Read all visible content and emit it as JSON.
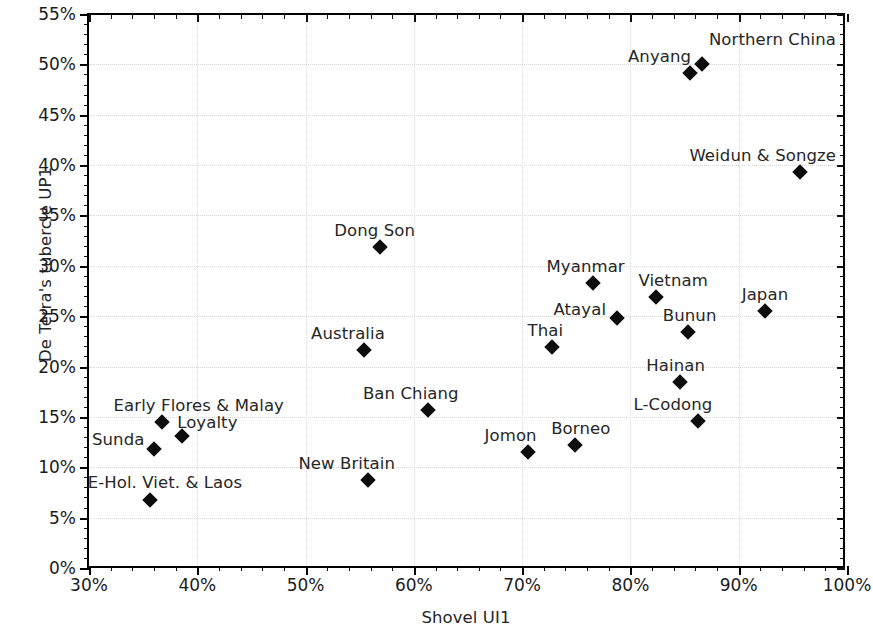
{
  "chart_data": {
    "type": "scatter",
    "title": "",
    "xlabel": "Shovel UI1",
    "ylabel": "De Terra's tubercle UP1",
    "xlim": [
      30,
      100
    ],
    "ylim": [
      0,
      55
    ],
    "xticks": [
      "30%",
      "40%",
      "50%",
      "60%",
      "70%",
      "80%",
      "90%",
      "100%"
    ],
    "xtick_values": [
      30,
      40,
      50,
      60,
      70,
      80,
      90,
      100
    ],
    "yticks": [
      "0%",
      "5%",
      "10%",
      "15%",
      "20%",
      "25%",
      "30%",
      "35%",
      "40%",
      "45%",
      "50%",
      "55%"
    ],
    "ytick_values": [
      0,
      5,
      10,
      15,
      20,
      25,
      30,
      35,
      40,
      45,
      50,
      55
    ],
    "grid": true,
    "legend": "none",
    "marker": "diamond",
    "marker_color": "#0d0d0d",
    "points": [
      {
        "label": "Northern China",
        "x": 86.6,
        "y": 50.0,
        "lx": 7,
        "ly": -34
      },
      {
        "label": "Anyang",
        "x": 85.5,
        "y": 49.1,
        "lx": -62,
        "ly": -26
      },
      {
        "label": "Weidun & Songze",
        "x": 95.7,
        "y": 39.3,
        "lx": -111,
        "ly": -26
      },
      {
        "label": "Dong Son",
        "x": 56.9,
        "y": 31.9,
        "lx": -46,
        "ly": -26
      },
      {
        "label": "Myanmar",
        "x": 76.5,
        "y": 28.3,
        "lx": -46,
        "ly": -26
      },
      {
        "label": "Vietnam",
        "x": 82.4,
        "y": 26.9,
        "lx": -18,
        "ly": -26
      },
      {
        "label": "Japan",
        "x": 92.4,
        "y": 25.5,
        "lx": -23,
        "ly": -26
      },
      {
        "label": "Atayal",
        "x": 78.8,
        "y": 24.8,
        "lx": -64,
        "ly": -18
      },
      {
        "label": "Bunun",
        "x": 85.3,
        "y": 23.4,
        "lx": -25,
        "ly": -26
      },
      {
        "label": "Thai",
        "x": 72.8,
        "y": 21.9,
        "lx": -25,
        "ly": -26
      },
      {
        "label": "Australia",
        "x": 55.4,
        "y": 21.6,
        "lx": -53,
        "ly": -26
      },
      {
        "label": "Hainan",
        "x": 84.6,
        "y": 18.5,
        "lx": -34,
        "ly": -26
      },
      {
        "label": "Ban Chiang",
        "x": 61.3,
        "y": 15.7,
        "lx": -65,
        "ly": -26
      },
      {
        "label": "L-Codong",
        "x": 86.2,
        "y": 14.6,
        "lx": -64,
        "ly": -26
      },
      {
        "label": "Early Flores & Malay",
        "x": 36.7,
        "y": 14.5,
        "lx": -48,
        "ly": -26
      },
      {
        "label": "Loyalty",
        "x": 38.6,
        "y": 13.1,
        "lx": -5,
        "ly": -23
      },
      {
        "label": "Borneo",
        "x": 74.9,
        "y": 12.2,
        "lx": -24,
        "ly": -26
      },
      {
        "label": "Sunda",
        "x": 36.0,
        "y": 11.8,
        "lx": -62,
        "ly": -19
      },
      {
        "label": "Jomon",
        "x": 70.5,
        "y": 11.5,
        "lx": -43,
        "ly": -26
      },
      {
        "label": "New Britain",
        "x": 55.8,
        "y": 8.7,
        "lx": -70,
        "ly": -26
      },
      {
        "label": "E-Hol. Viet. & Laos",
        "x": 35.6,
        "y": 6.8,
        "lx": -62,
        "ly": -27
      }
    ]
  }
}
